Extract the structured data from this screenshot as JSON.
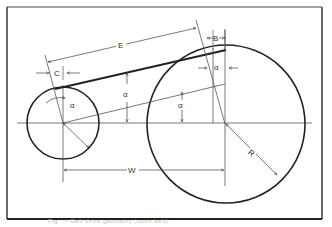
{
  "figure": {
    "labels": {
      "E": "E",
      "B": "B",
      "C": "C",
      "W": "W",
      "R": "R",
      "alpha": "α"
    },
    "caption": "Fig. — Belt drive geometry (open belt)",
    "colors": {
      "ink": "#222222",
      "thin": "#555555",
      "background": "#ffffff"
    }
  }
}
